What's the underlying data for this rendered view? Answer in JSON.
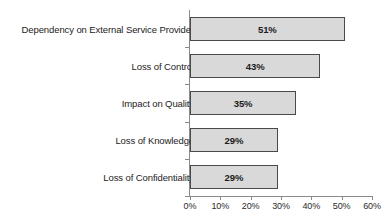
{
  "chart_data": {
    "type": "bar",
    "orientation": "horizontal",
    "title": "",
    "xlabel": "",
    "ylabel": "",
    "xlim": [
      0,
      60
    ],
    "xticks": [
      "0%",
      "10%",
      "20%",
      "30%",
      "40%",
      "50%",
      "60%"
    ],
    "xtick_values": [
      0,
      10,
      20,
      30,
      40,
      50,
      60
    ],
    "grid": false,
    "legend": false,
    "categories": [
      "Dependency on External Service Provider",
      "Loss of Control",
      "Impact on Quality",
      "Loss of Knowledge",
      "Loss of Confidentiality"
    ],
    "values": [
      51,
      43,
      35,
      29,
      29
    ],
    "value_labels": [
      "51%",
      "43%",
      "35%",
      "29%",
      "29%"
    ],
    "bar_fill_color": "#d9d9d9",
    "bar_border_color": "#4a4a4a",
    "axis_color": "#8a8a8a",
    "text_color": "#1c1c1c"
  }
}
